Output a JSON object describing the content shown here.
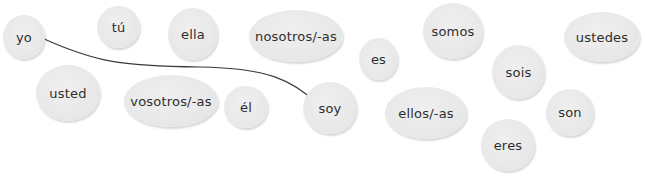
{
  "exercise": {
    "bubbles": [
      {
        "id": "yo",
        "label": "yo",
        "x": 3,
        "y": 15,
        "w": 42,
        "h": 44
      },
      {
        "id": "tu",
        "label": "tú",
        "x": 97,
        "y": 6,
        "w": 43,
        "h": 42
      },
      {
        "id": "ella",
        "label": "ella",
        "x": 168,
        "y": 8,
        "w": 50,
        "h": 52
      },
      {
        "id": "nosotros",
        "label": "nosotros/-as",
        "x": 249,
        "y": 10,
        "w": 94,
        "h": 52
      },
      {
        "id": "es",
        "label": "es",
        "x": 359,
        "y": 38,
        "w": 39,
        "h": 42
      },
      {
        "id": "somos",
        "label": "somos",
        "x": 423,
        "y": 3,
        "w": 60,
        "h": 56
      },
      {
        "id": "ustedes",
        "label": "ustedes",
        "x": 564,
        "y": 12,
        "w": 76,
        "h": 50
      },
      {
        "id": "sois",
        "label": "sois",
        "x": 492,
        "y": 45,
        "w": 53,
        "h": 54
      },
      {
        "id": "usted",
        "label": "usted",
        "x": 36,
        "y": 65,
        "w": 64,
        "h": 56
      },
      {
        "id": "vosotros",
        "label": "vosotros/-as",
        "x": 124,
        "y": 75,
        "w": 94,
        "h": 52
      },
      {
        "id": "el",
        "label": "él",
        "x": 224,
        "y": 86,
        "w": 44,
        "h": 42
      },
      {
        "id": "soy",
        "label": "soy",
        "x": 303,
        "y": 82,
        "w": 54,
        "h": 52
      },
      {
        "id": "ellos",
        "label": "ellos/-as",
        "x": 385,
        "y": 87,
        "w": 82,
        "h": 52
      },
      {
        "id": "son",
        "label": "son",
        "x": 546,
        "y": 89,
        "w": 48,
        "h": 47
      },
      {
        "id": "eres",
        "label": "eres",
        "x": 481,
        "y": 119,
        "w": 54,
        "h": 52
      }
    ],
    "connections": [
      {
        "from": "yo",
        "to": "soy"
      }
    ],
    "colors": {
      "bubble_fill": "#e9e9e9",
      "label_text": "#2e2e2e",
      "connector_line": "#3a3a3a"
    }
  }
}
